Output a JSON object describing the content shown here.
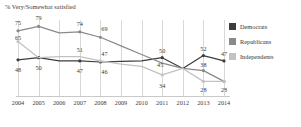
{
  "chart_data": {
    "type": "line",
    "title": "% Very/Somewhat satisfied",
    "xlabel": "",
    "ylabel": "",
    "ylim": [
      20,
      85
    ],
    "grid": "vertical",
    "legend_position": "right",
    "categories": [
      "2004",
      "2005",
      "2006",
      "2007",
      "2008",
      "2009",
      "2010",
      "2011",
      "2012",
      "2013",
      "2014"
    ],
    "series": [
      {
        "name": "Democrats",
        "color": "#3d3d3d",
        "values": [
          48,
          50,
          47,
          47,
          46,
          46.5,
          47,
          50,
          40,
          52,
          47
        ],
        "labels": {
          "2004": "48",
          "2005": "50",
          "2007": "47",
          "2008": "46",
          "2011": "50",
          "2013": "52",
          "2014": "47"
        }
      },
      {
        "name": "Republicans",
        "color": "#8a8a8a",
        "values": [
          75,
          79,
          73,
          74,
          69,
          61,
          53,
          45,
          40,
          38,
          28
        ],
        "labels": {
          "2004": "75",
          "2005": "79",
          "2007": "74",
          "2008": "69",
          "2013": "38",
          "2014": "28"
        }
      },
      {
        "name": "Independents",
        "color": "#c2c2c2",
        "values": [
          65,
          50,
          51,
          51,
          47,
          44,
          42,
          34,
          40,
          28,
          28
        ],
        "labels": {
          "2004": "65",
          "2008": "47",
          "2011": "34",
          "2013": "28",
          "2014": "28"
        }
      }
    ]
  },
  "legend": {
    "items": [
      {
        "label": "Democrats",
        "color": "#3d3d3d"
      },
      {
        "label": "Republicans",
        "color": "#8a8a8a"
      },
      {
        "label": "Independents",
        "color": "#c2c2c2"
      }
    ]
  },
  "point_labels": [
    {
      "text": "75",
      "x": 0,
      "y": 75,
      "dx": 0,
      "dy": -8,
      "series": "Republicans"
    },
    {
      "text": "79",
      "x": 1,
      "y": 79,
      "dx": 0,
      "dy": -8,
      "series": "Republicans"
    },
    {
      "text": "74",
      "x": 3,
      "y": 74,
      "dx": 0,
      "dy": -8,
      "series": "Republicans"
    },
    {
      "text": "69",
      "x": 4,
      "y": 69,
      "dx": 4,
      "dy": -8,
      "series": "Republicans"
    },
    {
      "text": "38",
      "x": 9,
      "y": 38,
      "dx": 0,
      "dy": -6,
      "series": "Republicans"
    },
    {
      "text": "28",
      "x": 9,
      "y": 28,
      "dx": 0,
      "dy": 9,
      "series": "Independents"
    },
    {
      "text": "28",
      "x": 10,
      "y": 28,
      "dx": 0,
      "dy": 9,
      "series": "Republicans"
    },
    {
      "text": "65",
      "x": 0,
      "y": 65,
      "dx": 0,
      "dy": -4,
      "series": "Independents"
    },
    {
      "text": "51",
      "x": 3,
      "y": 51,
      "dx": 0,
      "dy": -7,
      "series": "Independents"
    },
    {
      "text": "47",
      "x": 4,
      "y": 47,
      "dx": 4,
      "dy": -7,
      "series": "Independents"
    },
    {
      "text": "34",
      "x": 7,
      "y": 34,
      "dx": 0,
      "dy": 11,
      "series": "Independents"
    },
    {
      "text": "45",
      "x": 7,
      "y": 45,
      "dx": -2,
      "dy": 2,
      "series": "Independents"
    },
    {
      "text": "48",
      "x": 0,
      "y": 48,
      "dx": 0,
      "dy": 10,
      "series": "Democrats"
    },
    {
      "text": "50",
      "x": 1,
      "y": 50,
      "dx": 0,
      "dy": 10,
      "series": "Democrats"
    },
    {
      "text": "47",
      "x": 3,
      "y": 47,
      "dx": 0,
      "dy": 10,
      "series": "Democrats"
    },
    {
      "text": "46",
      "x": 4,
      "y": 46,
      "dx": 4,
      "dy": 10,
      "series": "Democrats"
    },
    {
      "text": "50",
      "x": 7,
      "y": 50,
      "dx": 0,
      "dy": -7,
      "series": "Democrats"
    },
    {
      "text": "52",
      "x": 9,
      "y": 52,
      "dx": 0,
      "dy": -7,
      "series": "Democrats"
    },
    {
      "text": "47",
      "x": 10,
      "y": 47,
      "dx": 0,
      "dy": -7,
      "series": "Democrats"
    }
  ]
}
